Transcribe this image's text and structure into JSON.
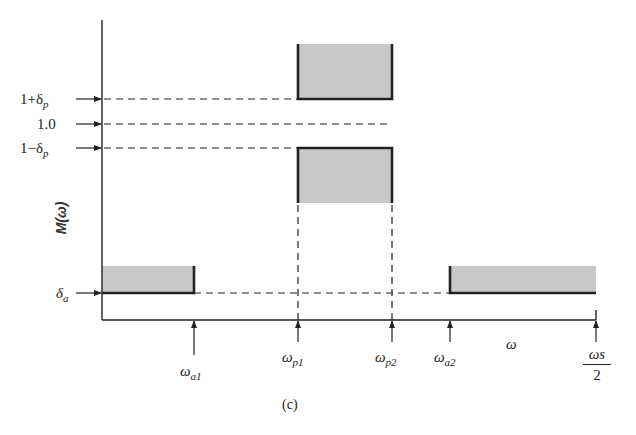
{
  "figure": {
    "caption": "(c)",
    "y_axis_label": "M(ω)",
    "x_axis_label": "ω"
  },
  "y_levels": [
    {
      "main": "1+δ",
      "sub": "p",
      "meaning": "upper passband tolerance"
    },
    {
      "main": "1.0",
      "sub": "",
      "meaning": "ideal passband gain"
    },
    {
      "main": "1−δ",
      "sub": "p",
      "meaning": "lower passband tolerance"
    },
    {
      "main": "δ",
      "sub": "a",
      "meaning": "stopband tolerance"
    }
  ],
  "x_marks": [
    {
      "main": "ω",
      "sub": "a1"
    },
    {
      "main": "ω",
      "sub": "p1"
    },
    {
      "main": "ω",
      "sub": "p2"
    },
    {
      "main": "ω",
      "sub": "a2"
    },
    {
      "num": "ωs",
      "den": "2"
    }
  ],
  "colors": {
    "tolerance_fill": "#c8c8c8",
    "line": "#222222"
  }
}
